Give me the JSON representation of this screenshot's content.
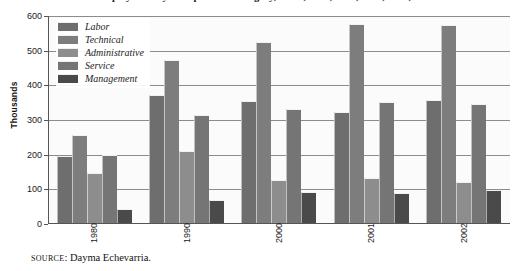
{
  "chart_data": {
    "type": "bar",
    "title": "Employment by Occupational Category, Cuba, 1980, 1990, 2000, 2001, 2002",
    "xlabel": "",
    "ylabel": "Thousands",
    "ylim": [
      0,
      600
    ],
    "ytick_labels": [
      "0",
      "100",
      "200",
      "300",
      "400",
      "500",
      "600"
    ],
    "yticks": [
      0,
      100,
      200,
      300,
      400,
      500,
      600
    ],
    "grid": true,
    "legend_position": "upper-left",
    "categories": [
      "1980",
      "1990",
      "2000",
      "2001",
      "2002"
    ],
    "series": [
      {
        "name": "Labor",
        "color": "#6e6e6e",
        "values": [
          195,
          373,
          355,
          322,
          358
        ]
      },
      {
        "name": "Technical",
        "color": "#7d7d7d",
        "values": [
          257,
          472,
          525,
          578,
          575
        ]
      },
      {
        "name": "Administrative",
        "color": "#8d8d8d",
        "values": [
          147,
          210,
          128,
          133,
          122
        ]
      },
      {
        "name": "Service",
        "color": "#757575",
        "values": [
          200,
          315,
          332,
          352,
          347
        ]
      },
      {
        "name": "Management",
        "color": "#4a4a4a",
        "values": [
          42,
          68,
          92,
          90,
          99
        ]
      }
    ]
  },
  "source": {
    "prefix": "SOURCE",
    "separator": ": ",
    "text": "Dayma Echevarria."
  }
}
